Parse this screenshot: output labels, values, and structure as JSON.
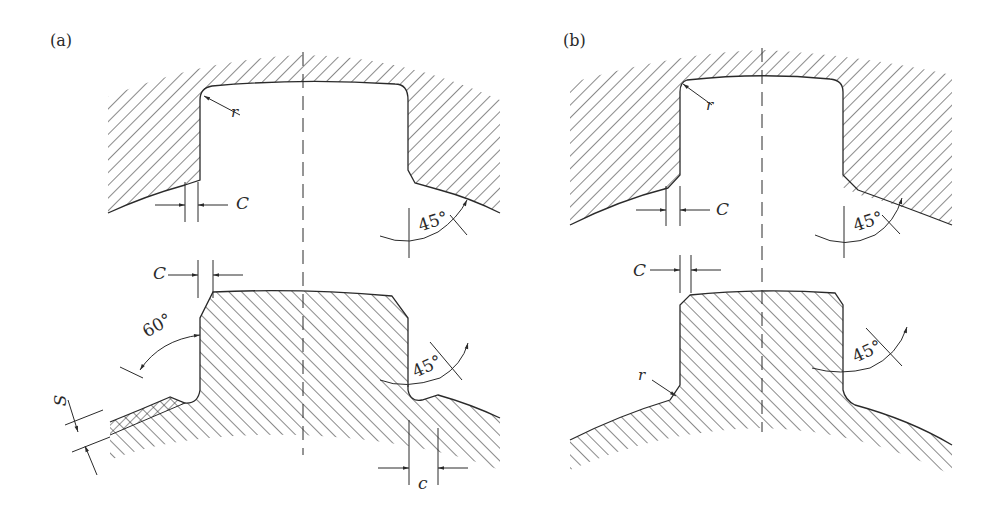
{
  "figure": {
    "panels": [
      {
        "id": "a",
        "label": "(a)",
        "dimensions": {
          "radius_upper": "r",
          "chamfer_upper": "C",
          "angle_upper": "45°",
          "chamfer_lower": "C",
          "angle_lower_left": "60°",
          "angle_lower_right": "45°",
          "thickness": "S",
          "gap": "c"
        }
      },
      {
        "id": "b",
        "label": "(b)",
        "dimensions": {
          "radius_upper": "r",
          "chamfer_upper": "C",
          "angle_upper": "45°",
          "chamfer_lower": "C",
          "angle_lower_right": "45°",
          "radius_lower": "r"
        }
      }
    ],
    "colors": {
      "line": "#2a2a2a",
      "background": "#ffffff"
    }
  }
}
